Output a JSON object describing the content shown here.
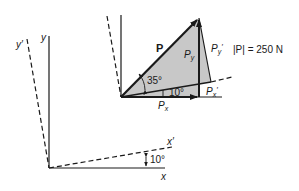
{
  "diagram": {
    "type": "force-vector-rotated-axes",
    "colors": {
      "line": "#1a1a1a",
      "fill": "#c8c8c8",
      "background": "#ffffff"
    },
    "force": {
      "label": "P",
      "magnitude_label": "|P| = 250 N",
      "angle_to_xprime_label": "35°",
      "axis_rotation_label": "10°"
    },
    "components": {
      "px": "P",
      "px_sub": "x",
      "py": "P",
      "py_sub": "y",
      "pxp": "P",
      "pxp_sub": "x",
      "pxp_prime": "′",
      "pyp": "P",
      "pyp_sub": "y",
      "pyp_prime": "′"
    },
    "lower_axes": {
      "x_label": "x",
      "y_label": "y",
      "xprime_label": "x′",
      "yprime_label": "y′",
      "angle_label": "10°"
    }
  }
}
